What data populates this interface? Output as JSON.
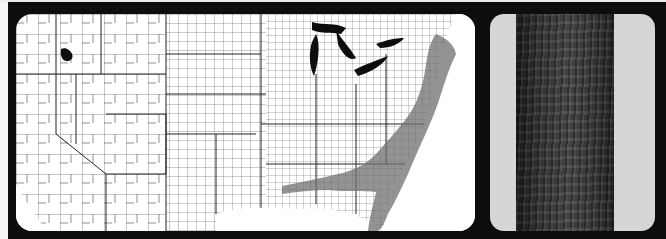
{
  "figure": {
    "panels": [
      {
        "id": "map",
        "description": "County outline map of the contiguous United States with shaded counties concentrated along the Atlantic and Gulf coastal plains and Northeast; one isolated dark county in the Intermountain West",
        "shaded_regions": [
          "Northeast",
          "Mid-Atlantic coastal plain",
          "Southeast coastal plain",
          "Gulf coastal plain",
          "Florida",
          "isolated county in northern Utah/Idaho"
        ]
      },
      {
        "id": "bark",
        "description": "Photograph of a dark, furrowed tree trunk against a light gray background"
      }
    ],
    "colors": {
      "frame": "#0d0d0d",
      "map_background": "#ffffff",
      "county_lines": "#333333",
      "shaded_counties": "#7a7a7a",
      "lakes": "#0d0d0d",
      "bark_background": "#d6d6d6"
    }
  }
}
